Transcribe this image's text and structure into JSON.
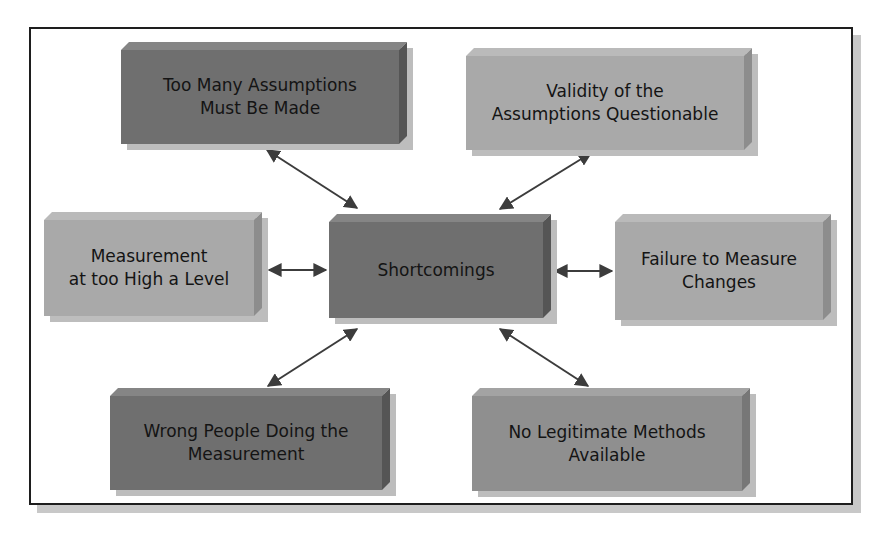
{
  "diagram": {
    "type": "hub-and-spoke",
    "center": {
      "label": "Shortcomings",
      "shade": "dark",
      "color": "#6f6f6f"
    },
    "nodes": [
      {
        "id": "top-left",
        "label": "Too Many Assumptions Must Be Made",
        "line1": "Too Many Assumptions",
        "line2": "Must Be Made",
        "shade": "dark",
        "color": "#6f6f6f"
      },
      {
        "id": "top-right",
        "label": "Validity of the Assumptions Questionable",
        "line1": "Validity of the",
        "line2": "Assumptions Questionable",
        "shade": "light",
        "color": "#a9a9a9"
      },
      {
        "id": "middle-left",
        "label": "Measurement at too High a Level",
        "line1": "Measurement",
        "line2": "at too High a Level",
        "shade": "light",
        "color": "#a9a9a9"
      },
      {
        "id": "middle-right",
        "label": "Failure to Measure Changes",
        "line1": "Failure to Measure",
        "line2": "Changes",
        "shade": "light",
        "color": "#a9a9a9"
      },
      {
        "id": "bottom-left",
        "label": "Wrong People Doing the Measurement",
        "line1": "Wrong People Doing the",
        "line2": "Measurement",
        "shade": "dark",
        "color": "#6f6f6f"
      },
      {
        "id": "bottom-right",
        "label": "No Legitimate Methods Available",
        "line1": "No Legitimate Methods",
        "line2": "Available",
        "shade": "medium",
        "color": "#8f8f8f"
      }
    ],
    "edges": [
      {
        "from": "center",
        "to": "top-left",
        "direction": "bidirectional"
      },
      {
        "from": "center",
        "to": "top-right",
        "direction": "bidirectional"
      },
      {
        "from": "center",
        "to": "middle-left",
        "direction": "bidirectional"
      },
      {
        "from": "center",
        "to": "middle-right",
        "direction": "bidirectional"
      },
      {
        "from": "center",
        "to": "bottom-left",
        "direction": "bidirectional"
      },
      {
        "from": "center",
        "to": "bottom-right",
        "direction": "bidirectional"
      }
    ],
    "arrow_color": "#3c3c3c",
    "frame_color": "#1e1e1e"
  }
}
